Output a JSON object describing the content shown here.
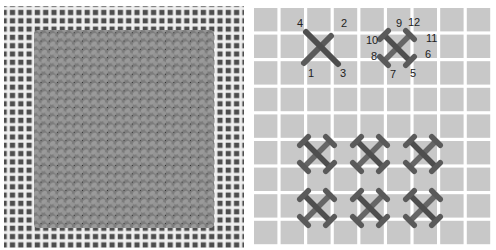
{
  "figure": {
    "left_panel": {
      "description": "Photograph of a stitched square on canvas mesh",
      "canvas_color": "#eeeeee",
      "mesh_hole_color": "#555555",
      "stitch_color": "#8a8a8a"
    },
    "right_panel": {
      "description": "Stitch diagram on grid",
      "grid_color": "#c8c8c8",
      "gap_color": "#ffffff",
      "thread_color": "#5a5a5a",
      "single_cross_labels": [
        {
          "text": "1",
          "x": 60,
          "y": 77
        },
        {
          "text": "2",
          "x": 93,
          "y": 27
        },
        {
          "text": "3",
          "x": 92,
          "y": 77
        },
        {
          "text": "4",
          "x": 49,
          "y": 27
        }
      ],
      "double_cross_labels": [
        {
          "text": "5",
          "x": 162,
          "y": 77
        },
        {
          "text": "6",
          "x": 177,
          "y": 58
        },
        {
          "text": "7",
          "x": 142,
          "y": 78
        },
        {
          "text": "8",
          "x": 123,
          "y": 60
        },
        {
          "text": "9",
          "x": 148,
          "y": 27
        },
        {
          "text": "10",
          "x": 118,
          "y": 44
        },
        {
          "text": "11",
          "x": 178,
          "y": 42
        },
        {
          "text": "12",
          "x": 160,
          "y": 26
        }
      ]
    }
  }
}
